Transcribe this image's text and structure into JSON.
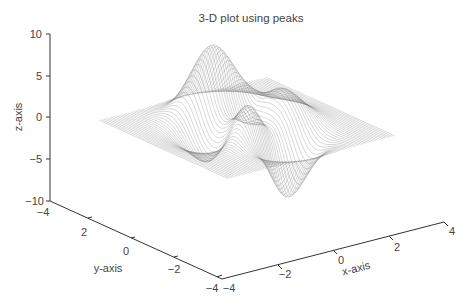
{
  "chart_data": {
    "type": "surface",
    "function": "peaks",
    "title": "3-D plot using peaks",
    "xlabel": "x-axis",
    "ylabel": "y-axis",
    "zlabel": "z-axis",
    "xlim": [
      -4,
      4
    ],
    "ylim": [
      -4,
      4
    ],
    "zlim": [
      -10,
      10
    ],
    "x_ticks": [
      "-4",
      "-2",
      "0",
      "2",
      "4"
    ],
    "y_ticks": [
      "-4",
      "-2",
      "0",
      "2",
      "-4"
    ],
    "z_ticks": [
      "10",
      "5",
      "0",
      "-5",
      "-10"
    ],
    "x_tick_labels": [
      "−4",
      "−2",
      "0",
      "2",
      "4"
    ],
    "y_tick_labels": [
      "−4",
      "2",
      "0",
      "−2",
      "−4"
    ],
    "z_tick_labels": [
      "10",
      "5",
      "0",
      "−5",
      "−10"
    ],
    "grid": false,
    "render_style": "mesh",
    "line_color": "#6a6a6a",
    "approx_max_z": 8.1,
    "approx_min_z": -6.5
  }
}
